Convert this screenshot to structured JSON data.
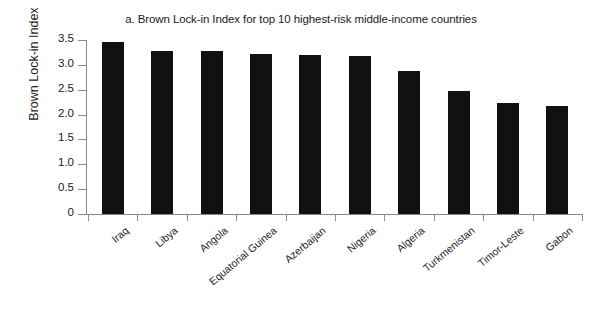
{
  "chart_data": {
    "type": "bar",
    "title": "a. Brown Lock-in Index for top 10 highest-risk middle-income countries",
    "xlabel": "",
    "ylabel": "Brown Lock-in Index",
    "ylim": [
      0,
      3.5
    ],
    "grid": false,
    "legend": "none",
    "bar_color": "#111111",
    "axis_color": "#8a8a8a",
    "categories": [
      "Iraq",
      "Libya",
      "Angola",
      "Equatorial Guinea",
      "Azerbaijan",
      "Nigeria",
      "Algeria",
      "Turkmenistan",
      "Timor-Leste",
      "Gabon"
    ],
    "values": [
      3.47,
      3.27,
      3.27,
      3.21,
      3.2,
      3.18,
      2.88,
      2.47,
      2.23,
      2.17
    ],
    "yticks": [
      0,
      0.5,
      1.0,
      1.5,
      2.0,
      2.5,
      3.0,
      3.5
    ],
    "ytick_labels": [
      "0",
      "0.5",
      "1.0",
      "1.5",
      "2.0",
      "2.5",
      "3.0",
      "3.5"
    ]
  }
}
